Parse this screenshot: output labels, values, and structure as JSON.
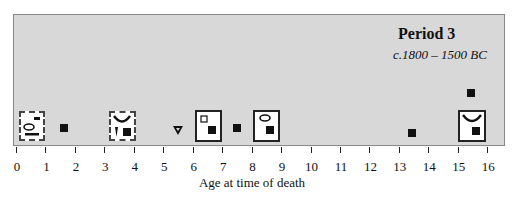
{
  "chart_data": {
    "type": "scatter",
    "title": "Period 3",
    "subtitle": "c.1800 – 1500 BC",
    "xlabel": "Age at time of death",
    "ylabel": "",
    "xlim": [
      0,
      16
    ],
    "x_ticks": [
      "0",
      "1",
      "2",
      "3",
      "4",
      "5",
      "6",
      "7",
      "8",
      "9",
      "10",
      "11",
      "12",
      "13",
      "14",
      "15",
      "16"
    ],
    "grid": false,
    "legend": null,
    "points": [
      {
        "age": 0.5,
        "marker": "dashed-box",
        "contents": [
          "small-bar",
          "ring",
          "long-bar"
        ]
      },
      {
        "age": 1.5,
        "marker": "filled-square"
      },
      {
        "age": 3.5,
        "marker": "dashed-box",
        "contents": [
          "crescent",
          "spike",
          "filled-square"
        ]
      },
      {
        "age": 5.5,
        "marker": "open-triangle"
      },
      {
        "age": 6.5,
        "marker": "solid-box",
        "contents": [
          "open-square",
          "filled-square"
        ]
      },
      {
        "age": 7.5,
        "marker": "filled-square"
      },
      {
        "age": 8.5,
        "marker": "solid-box",
        "contents": [
          "ring",
          "filled-square"
        ]
      },
      {
        "age": 13.5,
        "marker": "filled-square"
      },
      {
        "age": 15.5,
        "marker": "filled-square",
        "stacked": "upper"
      },
      {
        "age": 15.5,
        "marker": "solid-box",
        "contents": [
          "crescent",
          "filled-square"
        ]
      }
    ]
  },
  "labels": {
    "title": "Period 3",
    "subtitle": "c.1800 – 1500 BC",
    "xlabel": "Age at time of death",
    "ticks": [
      "0",
      "1",
      "2",
      "3",
      "4",
      "5",
      "6",
      "7",
      "8",
      "9",
      "10",
      "11",
      "12",
      "13",
      "14",
      "15",
      "16"
    ]
  }
}
